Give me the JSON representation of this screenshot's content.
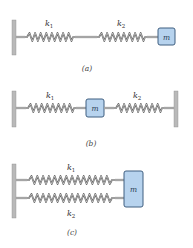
{
  "diagrams": {
    "a": {
      "caption": "(a)",
      "springs": [
        {
          "label": "k",
          "sub": "1"
        },
        {
          "label": "k",
          "sub": "2"
        }
      ],
      "mass_label": "m",
      "arrangement": "series"
    },
    "b": {
      "caption": "(b)",
      "springs": [
        {
          "label": "k",
          "sub": "1"
        },
        {
          "label": "k",
          "sub": "2"
        }
      ],
      "mass_label": "m",
      "arrangement": "mass between two walls"
    },
    "c": {
      "caption": "(c)",
      "springs": [
        {
          "label": "k",
          "sub": "1"
        },
        {
          "label": "k",
          "sub": "2"
        }
      ],
      "mass_label": "m",
      "arrangement": "parallel"
    }
  },
  "colors": {
    "mass_fill": "#b7d3ee",
    "mass_stroke": "#3f5f80",
    "wall": "#b9b9b9"
  }
}
